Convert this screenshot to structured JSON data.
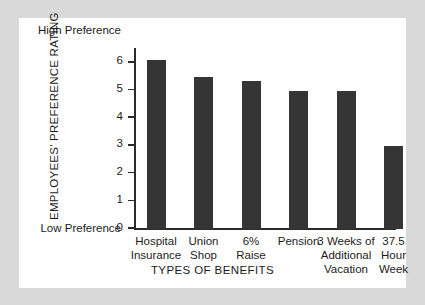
{
  "chart_data": {
    "type": "bar",
    "title": "",
    "xlabel": "TYPES OF BENEFITS",
    "ylabel": "EMPLOYEES' PREFERENCE RATING",
    "categories": [
      "Hospital Insurance",
      "Union Shop",
      "6% Raise",
      "Pension",
      "3 Weeks of Additional Vacation",
      "37.5 Hour Week"
    ],
    "category_lines": [
      [
        "Hospital",
        "Insurance"
      ],
      [
        "Union",
        "Shop"
      ],
      [
        "6%",
        "Raise"
      ],
      [
        "Pension"
      ],
      [
        "3 Weeks of",
        "Additional",
        "Vacation"
      ],
      [
        "37.5",
        "Hour",
        "Week"
      ]
    ],
    "values": [
      6.1,
      5.5,
      5.35,
      5.0,
      5.0,
      3.0
    ],
    "ylim": [
      0,
      6.5
    ],
    "yticks": [
      0,
      1,
      2,
      3,
      4,
      5,
      6
    ],
    "ytick_labels": [
      "0",
      "1",
      "2",
      "3",
      "4",
      "5",
      "6"
    ],
    "grid": false,
    "legend": false,
    "bar_color": "#353535",
    "axis_color": "#2b2b2b",
    "plot_background": "#ffffff",
    "page_background": "#d9d9d9",
    "annotations": {
      "high_label_line1": "High",
      "high_label_line2": "Preference",
      "low_label_line1": "Low",
      "low_label_line2": "Preference"
    }
  }
}
